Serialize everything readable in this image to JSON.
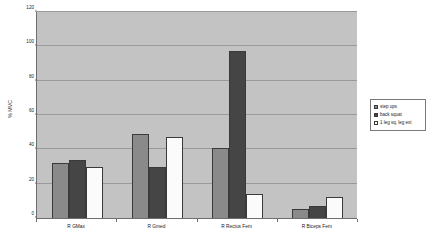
{
  "chart_data": {
    "type": "bar",
    "title": "",
    "xlabel": "",
    "ylabel": "% MVC",
    "ylim": [
      0,
      120
    ],
    "yticks": [
      0,
      20,
      40,
      60,
      80,
      100,
      120
    ],
    "grid": true,
    "legend_position": "right",
    "categories": [
      "R GMax",
      "R Gmed",
      "R Rectus Fem",
      "R Biceps Fem"
    ],
    "series": [
      {
        "name": "step ups",
        "color": "#8a8a8a",
        "values": [
          32,
          49,
          41,
          5
        ]
      },
      {
        "name": "back squat",
        "color": "#454545",
        "values": [
          34,
          30,
          97,
          7
        ]
      },
      {
        "name": "1 leg sq, leg ext",
        "color": "#fbfbfb",
        "values": [
          30,
          47,
          14,
          12
        ]
      }
    ]
  },
  "plot": {
    "background_color": "#c3c3c3",
    "axis_color": "#6d6d6d",
    "gridline_color": "#9a9a9a"
  }
}
